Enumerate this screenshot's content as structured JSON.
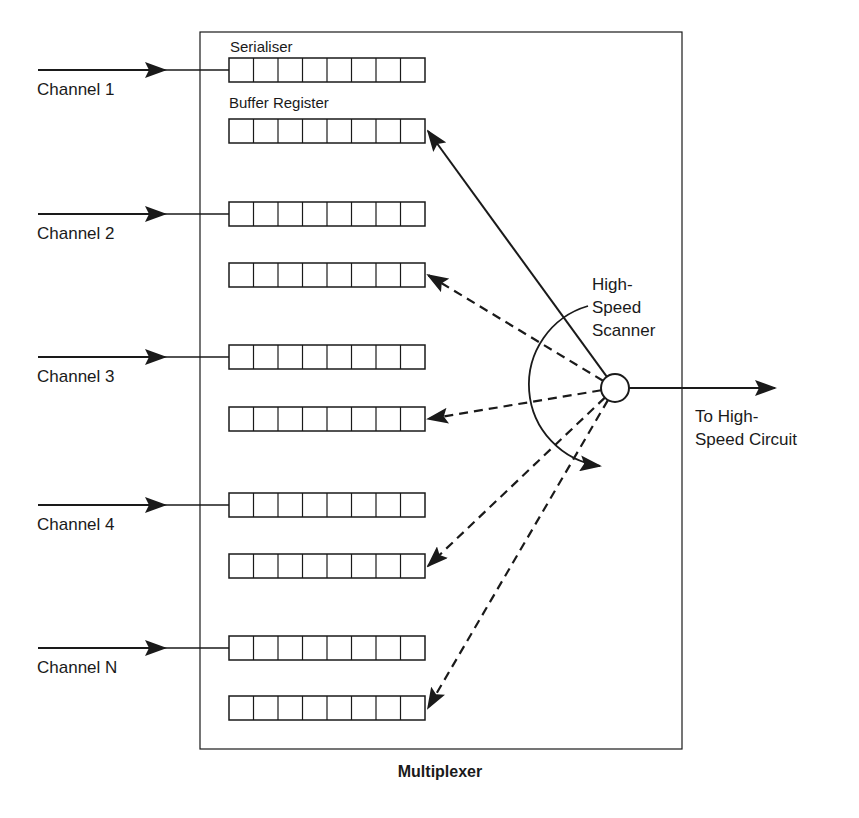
{
  "title": "Multiplexer",
  "labels": {
    "serialiser": "Serialiser",
    "buffer_register": "Buffer Register",
    "scanner_line1": "High-",
    "scanner_line2": "Speed",
    "scanner_line3": "Scanner",
    "output_line1": "To High-",
    "output_line2": "Speed Circuit"
  },
  "channels": [
    {
      "label": "Channel 1",
      "serialiser_y": 58,
      "buffer_y": 119,
      "scan": "solid"
    },
    {
      "label": "Channel 2",
      "serialiser_y": 202,
      "buffer_y": 263,
      "scan": "dashed"
    },
    {
      "label": "Channel 3",
      "serialiser_y": 345,
      "buffer_y": 407,
      "scan": "dashed"
    },
    {
      "label": "Channel 4",
      "serialiser_y": 493,
      "buffer_y": 554,
      "scan": "dashed"
    },
    {
      "label": "Channel N",
      "serialiser_y": 636,
      "buffer_y": 696,
      "scan": "dashed"
    }
  ],
  "register_cells": 8,
  "colors": {
    "ink": "#1a1a1a",
    "background": "#ffffff"
  }
}
